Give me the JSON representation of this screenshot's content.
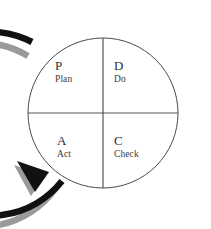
{
  "diagram": {
    "name": "PDCA Cycle",
    "type": "cycle-diagram",
    "shape": "circle-divided-in-quadrants-with-encircling-arrow",
    "direction": "counterclockwise",
    "background_color": "#ffffff",
    "circle": {
      "outline_color": "#4a4a4a",
      "fill_color": "#ffffff",
      "center_x": 103,
      "center_y": 113,
      "radius": 75
    },
    "divider": {
      "color": "#555555",
      "vertical": true,
      "horizontal": true
    },
    "arrow": {
      "color": "#111111",
      "shadow_color": "#9a9a9a",
      "head_position": "bottom-left",
      "tail_position": "top-left"
    },
    "quadrants": [
      {
        "id": "plan",
        "position": "top-left",
        "letter": "P",
        "word": "Plan"
      },
      {
        "id": "do",
        "position": "top-right",
        "letter": "D",
        "word": "Do"
      },
      {
        "id": "act",
        "position": "bottom-left",
        "letter": "A",
        "word": "Act"
      },
      {
        "id": "check",
        "position": "bottom-right",
        "letter": "C",
        "word": "Check"
      }
    ]
  }
}
